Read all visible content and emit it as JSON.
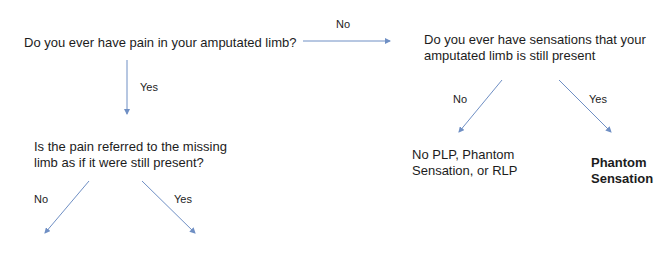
{
  "diagram": {
    "type": "decision-tree",
    "colors": {
      "text": "#1c1c1c",
      "arrow": "#6f8fc4",
      "background": "#ffffff"
    },
    "nodes": {
      "q_pain": {
        "text": "Do you ever have pain in your amputated limb?"
      },
      "q_sensation": {
        "line1": "Do you ever have sensations that your",
        "line2": "amputated limb is still present"
      },
      "q_referred": {
        "line1": "Is the pain referred to the missing",
        "line2": "limb as if it were still present?"
      },
      "r_none": {
        "line1": "No PLP, Phantom",
        "line2": "Sensation, or RLP"
      },
      "r_phantom_sensation": {
        "line1": "Phantom",
        "line2": "Sensation"
      }
    },
    "edges": [
      {
        "from": "q_pain",
        "to": "q_sensation",
        "label": "No"
      },
      {
        "from": "q_pain",
        "to": "q_referred",
        "label": "Yes"
      },
      {
        "from": "q_sensation",
        "to": "r_none",
        "label": "No"
      },
      {
        "from": "q_sensation",
        "to": "r_phantom_sensation",
        "label": "Yes"
      },
      {
        "from": "q_referred",
        "to": "(cut off)",
        "label": "No"
      },
      {
        "from": "q_referred",
        "to": "(cut off)",
        "label": "Yes"
      }
    ]
  }
}
